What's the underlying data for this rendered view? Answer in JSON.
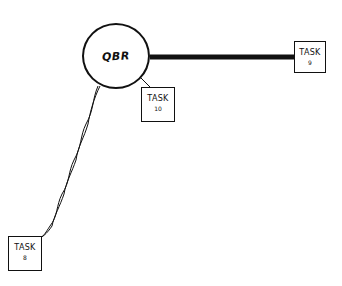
{
  "diagram": {
    "hub": {
      "label": "QBR"
    },
    "tasks": [
      {
        "id": "task-9",
        "label": "TASK",
        "number": "9"
      },
      {
        "id": "task-10",
        "label": "TASK",
        "number": "10"
      },
      {
        "id": "task-8",
        "label": "TASK",
        "number": "8"
      }
    ],
    "edges": [
      {
        "from": "QBR",
        "to": "TASK 9",
        "style": "thick"
      },
      {
        "from": "QBR",
        "to": "TASK 10",
        "style": "thin"
      },
      {
        "from": "QBR",
        "to": "TASK 8",
        "style": "twisted"
      }
    ],
    "colors": {
      "stroke": "#111111",
      "background": "#ffffff"
    }
  }
}
